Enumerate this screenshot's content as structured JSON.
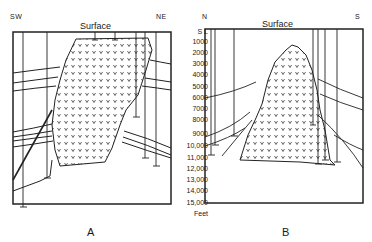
{
  "panel_a": {
    "label": "A",
    "left_dir": "SW",
    "right_dir": "NE",
    "surface_label": "Surface"
  },
  "panel_b": {
    "label": "B",
    "left_dir": "N",
    "right_dir": "S",
    "surface_label": "Surface"
  },
  "depth_scale": {
    "top_label": "S L",
    "ticks": [
      "1000",
      "2000",
      "3000",
      "4000",
      "5000",
      "6000",
      "7000",
      "8000",
      "9000",
      "10,000",
      "11,000",
      "12,000",
      "13,000",
      "14,000",
      "15,000"
    ],
    "unit": "Feet"
  }
}
